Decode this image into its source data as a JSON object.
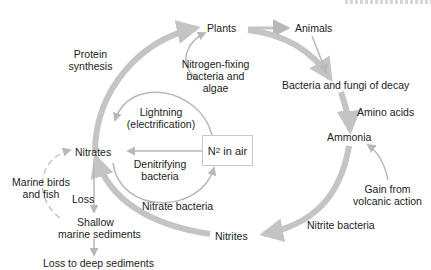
{
  "diagram": {
    "nodes": {
      "plants": "Plants",
      "animals": "Animals",
      "decay": "Bacteria and fungi of decay",
      "ammonia": "Ammonia",
      "nitrites": "Nitrites",
      "nitrates": "Nitrates",
      "n2_main": "N",
      "n2_sub": "2",
      "n2_rest": " in air",
      "shallow_1": "Shallow",
      "shallow_2": "marine sediments",
      "deep": "Loss to deep sediments"
    },
    "edge_labels": {
      "protein_1": "Protein",
      "protein_2": "synthesis",
      "nfix_1": "Nitrogen-fixing",
      "nfix_2": "bacteria and",
      "nfix_3": "algae",
      "lightning_1": "Lightning",
      "lightning_2": "(electrification)",
      "denit_1": "Denitrifying",
      "denit_2": "bacteria",
      "amino": "Amino acids",
      "volcanic_1": "Gain from",
      "volcanic_2": "volcanic action",
      "nitrite_bact": "Nitrite bacteria",
      "nitrate_bact": "Nitrate bacteria",
      "marine_1": "Marine birds",
      "marine_2": "and fish",
      "loss": "Loss"
    },
    "colors": {
      "arrow": "#c4c4c4",
      "arrow_thin": "#b8b8b8",
      "text": "#222222",
      "box_border": "#c8c8c8"
    }
  }
}
